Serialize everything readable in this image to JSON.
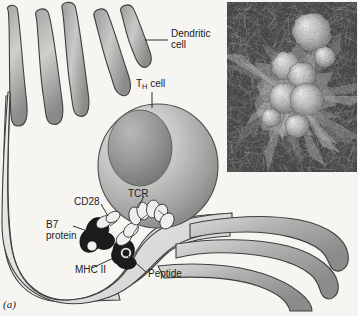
{
  "figure": {
    "panel_letter": "(a)",
    "domain": "immunology-antigen-presentation-diagram",
    "background_color": "#f6f5f2"
  },
  "labels": {
    "dendritic_cell": {
      "line1": "Dendritic",
      "line2": "cell"
    },
    "th_cell": {
      "prefix": "T",
      "subscript": "H",
      "suffix": " cell"
    },
    "cd28": "CD28",
    "tcr": "TCR",
    "b7_protein": {
      "line1": "B7",
      "line2": "protein"
    },
    "mhc_ii": "MHC II",
    "peptide": "Peptide"
  },
  "colors": {
    "cell_fill_light": "#e3e3e1",
    "cell_fill_mid": "#b9b9b7",
    "cell_fill_dark": "#8d8d8b",
    "cell_outline": "#3f3f3f",
    "th_cell_light": "#e8e8e6",
    "th_cell_mid": "#b4b4b2",
    "th_cell_dark": "#7e7e7c",
    "nucleus_dark": "#6e6e6c",
    "receptor_dark": "#1c1c1c",
    "receptor_light": "#efefed",
    "label_text": "#1a1a1a",
    "leader_line": "#1a1a1a"
  },
  "micrograph": {
    "type": "scanning-electron-micrograph",
    "description": "Dendritic cell with clustered rounded lymphocytes",
    "x": 227,
    "y": 2,
    "width": 130,
    "height": 170
  },
  "structures": {
    "dendritic_cell": "antigen-presenting cell with finger-like dendrite projections",
    "th_cell": "helper T cell sphere with nucleus",
    "synapse": "immunological synapse with TCR-MHC II and CD28-B7 contacts"
  }
}
